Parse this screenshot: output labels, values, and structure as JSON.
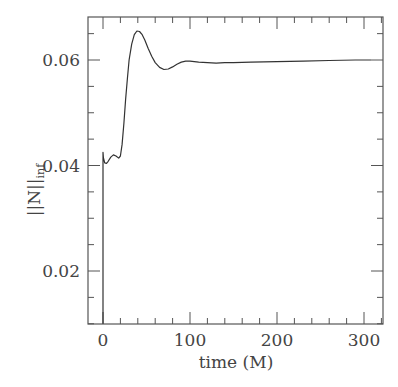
{
  "chart_data": {
    "type": "line",
    "title": "",
    "xlabel": "time (M)",
    "ylabel": "||N||",
    "ylabel_subscript": "inf",
    "xlim": [
      -15,
      320
    ],
    "ylim": [
      0.01,
      0.068
    ],
    "x_ticks": [
      0,
      100,
      200,
      300
    ],
    "x_tick_labels": [
      "0",
      "100",
      "200",
      "300"
    ],
    "x_minor_step": 20,
    "y_ticks": [
      0.02,
      0.04,
      0.06
    ],
    "y_tick_labels": [
      "0.02",
      "0.04",
      "0.06"
    ],
    "y_minor_step": 0.005,
    "grid": false,
    "legend": null,
    "series": [
      {
        "name": "||N||_inf",
        "color": "#333333",
        "x": [
          0,
          0,
          0.5,
          2,
          4,
          6,
          9,
          12,
          15,
          18,
          20,
          22,
          24,
          26,
          28,
          30,
          33,
          36,
          39,
          42,
          45,
          48,
          52,
          56,
          60,
          65,
          70,
          75,
          80,
          85,
          90,
          95,
          100,
          105,
          110,
          120,
          130,
          140,
          150,
          170,
          200,
          230,
          260,
          290,
          308
        ],
        "y": [
          0.01,
          0.0425,
          0.0415,
          0.0405,
          0.0404,
          0.0408,
          0.0416,
          0.042,
          0.0418,
          0.0414,
          0.0418,
          0.044,
          0.048,
          0.0525,
          0.0565,
          0.06,
          0.063,
          0.0648,
          0.0655,
          0.0654,
          0.0648,
          0.0638,
          0.0622,
          0.0607,
          0.0595,
          0.0586,
          0.0582,
          0.0583,
          0.0587,
          0.0592,
          0.0596,
          0.0598,
          0.0598,
          0.0597,
          0.0596,
          0.0595,
          0.0594,
          0.0595,
          0.0595,
          0.0596,
          0.0597,
          0.0598,
          0.0599,
          0.06,
          0.06
        ]
      }
    ]
  }
}
